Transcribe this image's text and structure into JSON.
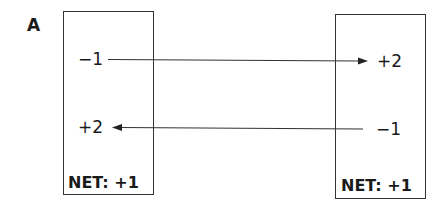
{
  "panel_label": "A",
  "left_box": {
    "top_value": "−1",
    "bottom_value": "+2",
    "net_label": "NET: +1"
  },
  "right_box": {
    "top_value": "+2",
    "bottom_value": "−1",
    "net_label": "NET: +1"
  },
  "arrows": [
    {
      "from": "left_box.top_value",
      "to": "right_box.top_value",
      "direction": "right"
    },
    {
      "from": "right_box.bottom_value",
      "to": "left_box.bottom_value",
      "direction": "left"
    }
  ]
}
